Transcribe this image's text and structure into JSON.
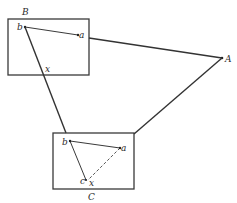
{
  "diagram": {
    "labels": {
      "A": "A",
      "B": "B",
      "C": "C",
      "b_in_B": "b",
      "a_in_B": "a",
      "x_in_B": "x",
      "b_in_C": "b",
      "a_in_C": "a",
      "c_in_C": "c",
      "x_in_C": "x"
    },
    "colors": {
      "ink": "#333333",
      "background": "#ffffff"
    }
  }
}
